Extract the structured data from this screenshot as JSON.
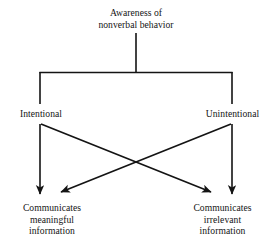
{
  "diagram": {
    "type": "flowchart",
    "title_node": {
      "id": "awareness",
      "text": "Awareness of\nnonverbal behavior"
    },
    "branch_nodes": [
      {
        "id": "intentional",
        "text": "Intentional"
      },
      {
        "id": "unintentional",
        "text": "Unintentional"
      }
    ],
    "outcome_nodes": [
      {
        "id": "meaningful",
        "text": "Communicates\nmeaningful\ninformation"
      },
      {
        "id": "irrelevant",
        "text": "Communicates\nirrelevant\ninformation"
      }
    ],
    "edges": [
      {
        "from": "awareness",
        "to": "branch-bar",
        "style": "plain"
      },
      {
        "from": "branch-bar",
        "to": "intentional",
        "style": "plain"
      },
      {
        "from": "branch-bar",
        "to": "unintentional",
        "style": "plain"
      },
      {
        "from": "intentional",
        "to": "meaningful",
        "style": "arrow",
        "shape": "vertical"
      },
      {
        "from": "intentional",
        "to": "irrelevant",
        "style": "arrow",
        "shape": "diagonal"
      },
      {
        "from": "unintentional",
        "to": "irrelevant",
        "style": "arrow",
        "shape": "vertical"
      },
      {
        "from": "unintentional",
        "to": "meaningful",
        "style": "arrow",
        "shape": "diagonal"
      }
    ],
    "colors": {
      "background": "#ffffff",
      "line": "#141414",
      "text": "#141414"
    }
  }
}
